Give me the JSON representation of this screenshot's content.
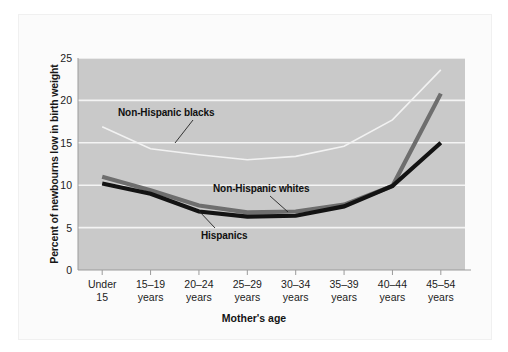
{
  "chart_data": {
    "type": "line",
    "title": "",
    "xlabel": "Mother's age",
    "ylabel": "Percent of newbourns low in birth weight",
    "categories": [
      "Under 15",
      "15–19 years",
      "20–24 years",
      "25–29 years",
      "30–34 years",
      "35–39 years",
      "40–44 years",
      "45–54 years"
    ],
    "category_lines": [
      [
        "Under",
        "15"
      ],
      [
        "15–19",
        "years"
      ],
      [
        "20–24",
        "years"
      ],
      [
        "25–29",
        "years"
      ],
      [
        "30–34",
        "years"
      ],
      [
        "35–39",
        "years"
      ],
      [
        "40–44",
        "years"
      ],
      [
        "45–54",
        "years"
      ]
    ],
    "ylim": [
      0,
      25
    ],
    "yticks": [
      0,
      5,
      10,
      15,
      20,
      25
    ],
    "ytick_labels": [
      "0",
      "5",
      "10",
      "15",
      "20",
      "25"
    ],
    "grid": "horizontal-white",
    "legend": "in-plot-annotations",
    "plot_background": "#c9c9c9",
    "series": [
      {
        "name": "Non-Hispanic blacks",
        "color": "#f2f2f2",
        "width": 1.6,
        "values": [
          16.9,
          14.3,
          13.6,
          13.0,
          13.4,
          14.6,
          17.7,
          23.6
        ]
      },
      {
        "name": "Non-Hispanic whites",
        "color": "#6e6e6e",
        "width": 4.2,
        "values": [
          11.0,
          9.4,
          7.6,
          6.8,
          6.9,
          7.7,
          9.9,
          20.8
        ]
      },
      {
        "name": "Hispanics",
        "color": "#131313",
        "width": 4.2,
        "values": [
          10.2,
          9.0,
          6.9,
          6.3,
          6.4,
          7.5,
          9.9,
          15.0
        ]
      }
    ],
    "annotations": [
      {
        "text": "Non-Hispanic blacks",
        "leader_from": [
          193,
          120
        ],
        "leader_to": [
          175,
          143
        ]
      },
      {
        "text": "Non-Hispanic whites",
        "leader_from": [
          270,
          196
        ],
        "leader_to": [
          288,
          212
        ]
      },
      {
        "text": "Hispanics",
        "leader_from": [
          215,
          228
        ],
        "leader_to": [
          199,
          211
        ]
      }
    ]
  },
  "figure": {
    "axis_color": "#9b9b9b",
    "text_color": "#1b1b1b"
  }
}
